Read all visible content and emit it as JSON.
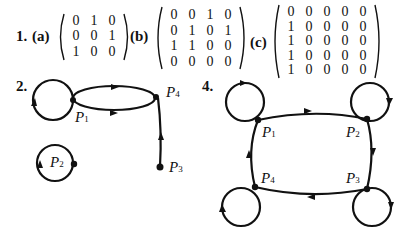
{
  "problem1": {
    "number": "1.",
    "parts": [
      {
        "label": "(a)",
        "rows": [
          [
            "0",
            "1",
            "0"
          ],
          [
            "0",
            "0",
            "1"
          ],
          [
            "1",
            "0",
            "0"
          ]
        ]
      },
      {
        "label": "(b)",
        "rows": [
          [
            "0",
            "0",
            "1",
            "0"
          ],
          [
            "0",
            "1",
            "0",
            "1"
          ],
          [
            "1",
            "1",
            "0",
            "0"
          ],
          [
            "0",
            "0",
            "0",
            "0"
          ]
        ]
      },
      {
        "label": "(c)",
        "rows": [
          [
            "0",
            "0",
            "0",
            "0",
            "0"
          ],
          [
            "1",
            "0",
            "0",
            "0",
            "0"
          ],
          [
            "1",
            "0",
            "0",
            "0",
            "0"
          ],
          [
            "1",
            "0",
            "0",
            "0",
            "0"
          ],
          [
            "1",
            "0",
            "0",
            "0",
            "0"
          ]
        ]
      }
    ]
  },
  "problem2": {
    "number": "2.",
    "vertices": [
      {
        "name": "P",
        "sub": "1"
      },
      {
        "name": "P",
        "sub": "2"
      },
      {
        "name": "P",
        "sub": "3"
      },
      {
        "name": "P",
        "sub": "4"
      }
    ]
  },
  "problem4": {
    "number": "4.",
    "vertices": [
      {
        "name": "P",
        "sub": "1"
      },
      {
        "name": "P",
        "sub": "2"
      },
      {
        "name": "P",
        "sub": "3"
      },
      {
        "name": "P",
        "sub": "4"
      }
    ]
  }
}
